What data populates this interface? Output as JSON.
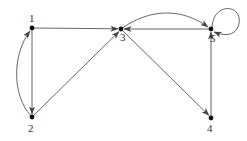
{
  "diagram": {
    "type": "directed-graph",
    "nodes": [
      {
        "id": "1",
        "label": "1",
        "x": 32,
        "y": 28
      },
      {
        "id": "2",
        "label": "2",
        "x": 32,
        "y": 117
      },
      {
        "id": "3",
        "label": "3",
        "x": 121,
        "y": 29
      },
      {
        "id": "4",
        "label": "4",
        "x": 211,
        "y": 118
      },
      {
        "id": "5",
        "label": "5",
        "x": 211,
        "y": 29
      }
    ],
    "edges": [
      {
        "from": "1",
        "to": "3",
        "style": "straight"
      },
      {
        "from": "1",
        "to": "2",
        "style": "straight"
      },
      {
        "from": "2",
        "to": "1",
        "style": "curved"
      },
      {
        "from": "2",
        "to": "3",
        "style": "straight"
      },
      {
        "from": "3",
        "to": "5",
        "style": "curved"
      },
      {
        "from": "5",
        "to": "3",
        "style": "straight"
      },
      {
        "from": "3",
        "to": "4",
        "style": "straight"
      },
      {
        "from": "4",
        "to": "5",
        "style": "straight"
      },
      {
        "from": "5",
        "to": "5",
        "style": "self-loop"
      }
    ],
    "colors": {
      "stroke": "#444444",
      "node": "#111111",
      "label": "#333333"
    }
  }
}
